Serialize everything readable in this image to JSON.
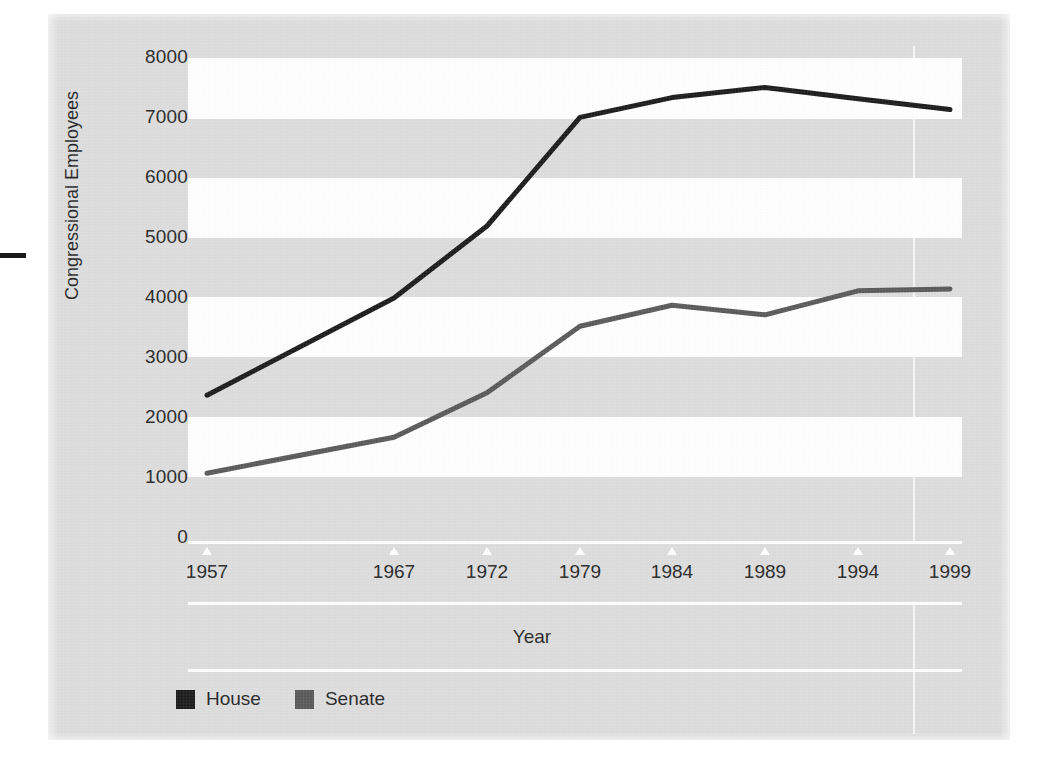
{
  "figure": {
    "background_color": "#dcdcdc",
    "band_color": "#ffffff",
    "rule_color": "#ffffff"
  },
  "axes": {
    "y_title": "Congressional Employees",
    "x_title": "Year",
    "y_ticks": [
      "8000",
      "7000",
      "6000",
      "5000",
      "4000",
      "3000",
      "2000",
      "1000",
      "0"
    ],
    "x_ticks": [
      "1957",
      "1967",
      "1972",
      "1979",
      "1984",
      "1989",
      "1994",
      "1999"
    ]
  },
  "legend": {
    "items": [
      {
        "label": "House",
        "color": "#151515"
      },
      {
        "label": "Senate",
        "color": "#555555"
      }
    ]
  },
  "chart_data": {
    "type": "line",
    "title": "",
    "xlabel": "Year",
    "ylabel": "Congressional Employees",
    "categories": [
      "1957",
      "1967",
      "1972",
      "1979",
      "1984",
      "1989",
      "1994",
      "1999"
    ],
    "x": [
      1957,
      1967,
      1972,
      1979,
      1984,
      1989,
      1994,
      1999
    ],
    "ylim": [
      0,
      8000
    ],
    "ytick_values": [
      0,
      1000,
      2000,
      3000,
      4000,
      5000,
      6000,
      7000,
      8000
    ],
    "grid": "horizontal-bands",
    "legend_position": "bottom-left",
    "series": [
      {
        "name": "House",
        "color": "#151515",
        "values": [
          2380,
          4000,
          5200,
          7010,
          7340,
          7510,
          7320,
          7140
        ]
      },
      {
        "name": "Senate",
        "color": "#555555",
        "values": [
          1080,
          1680,
          2420,
          3530,
          3880,
          3720,
          4120,
          4150
        ]
      }
    ]
  }
}
